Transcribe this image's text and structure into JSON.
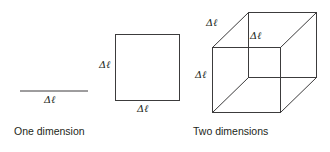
{
  "figure": {
    "background_color": "#ffffff",
    "line_color": "#3c3b3c",
    "text_color": "#231f20",
    "panels": [
      {
        "id": "one-dimension",
        "caption": "One dimension",
        "shape": "line-segment",
        "labels": [
          "Δℓ"
        ]
      },
      {
        "id": "two-dimensions",
        "caption": "Two dimensions",
        "shape": "square",
        "labels": [
          "Δℓ",
          "Δℓ"
        ]
      },
      {
        "id": "three-dimensions",
        "caption": "Three dimensions",
        "shape": "cube",
        "labels": [
          "Δℓ",
          "Δℓ",
          "Δℓ"
        ]
      }
    ]
  },
  "labels": {
    "delta_ell": "Δℓ",
    "delta": "Δ",
    "ell": "ℓ"
  },
  "captions": {
    "one": "One dimension",
    "two": "Two dimensions",
    "three": "Three dimensions"
  },
  "dimension_labels": {
    "line_length": "Δℓ",
    "square_height": "Δℓ",
    "square_width": "Δℓ",
    "cube_depth": "Δℓ",
    "cube_width": "Δℓ",
    "cube_height": "Δℓ"
  }
}
